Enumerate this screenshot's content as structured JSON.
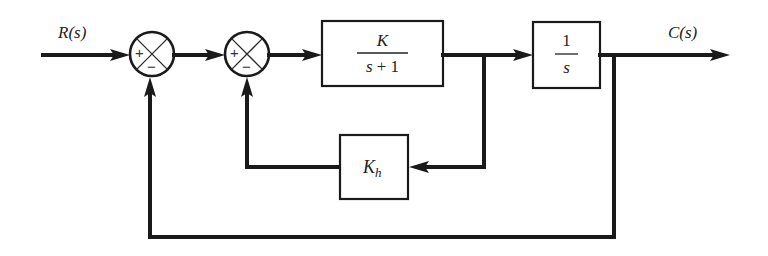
{
  "diagram": {
    "type": "control-system-block-diagram",
    "input_label": "R(s)",
    "output_label": "C(s)",
    "summing_junctions": [
      {
        "id": "sum1",
        "plus_sign": "+",
        "minus_sign": "−"
      },
      {
        "id": "sum2",
        "plus_sign": "+",
        "minus_sign": "−"
      }
    ],
    "blocks": {
      "plant": {
        "numerator": "K",
        "denominator": "s + 1"
      },
      "integrator": {
        "numerator": "1",
        "denominator": "s"
      },
      "feedback": {
        "symbol": "K",
        "subscript": "h"
      }
    },
    "colors": {
      "line": "#1a1a1a",
      "background": "#ffffff"
    }
  }
}
